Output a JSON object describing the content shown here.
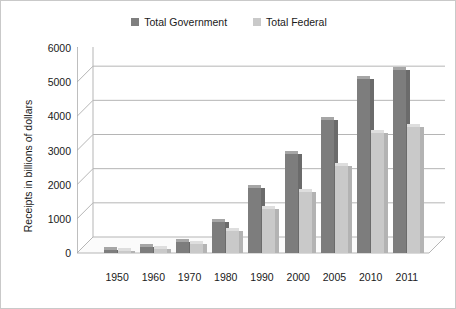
{
  "chart_data": {
    "type": "bar",
    "title": "",
    "xlabel": "",
    "ylabel": "Receipts in billions of dollars",
    "categories": [
      "1950",
      "1960",
      "1970",
      "1980",
      "1990",
      "2000",
      "2005",
      "2010",
      "2011"
    ],
    "series": [
      {
        "name": "Total Government",
        "color": "#7d7d7d",
        "values": [
          100,
          170,
          330,
          900,
          1900,
          2900,
          3900,
          5100,
          5350
        ]
      },
      {
        "name": "Total Federal",
        "color": "#c9c9c9",
        "values": [
          60,
          110,
          250,
          650,
          1300,
          1800,
          2550,
          3500,
          3700
        ]
      }
    ],
    "ylim": [
      0,
      6000
    ],
    "yticks": [
      "0",
      "1000",
      "2000",
      "3000",
      "4000",
      "5000",
      "6000"
    ],
    "ytick_values": [
      0,
      1000,
      2000,
      3000,
      4000,
      5000,
      6000
    ],
    "grid": true,
    "legend_position": "top-center",
    "style": "3d-perspective"
  }
}
